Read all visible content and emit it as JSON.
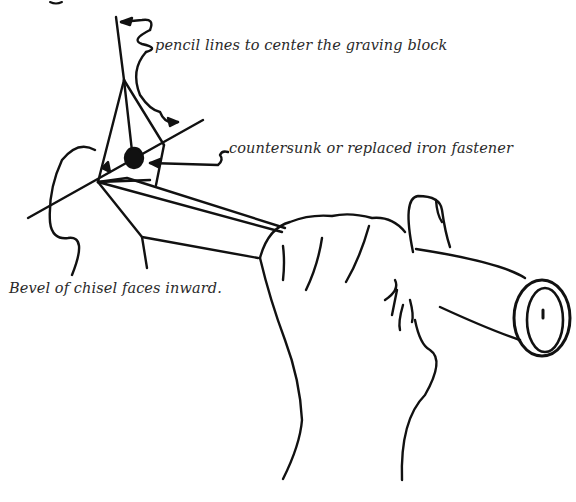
{
  "figure": {
    "ink_color": "#111111",
    "background_color": "#ffffff",
    "text_color": "#2a2a2a"
  },
  "annotations": {
    "pencil_lines": "pencil lines to center the graving block",
    "fastener": "countersunk or replaced iron fastener",
    "bevel": "Bevel of chisel faces inward."
  }
}
